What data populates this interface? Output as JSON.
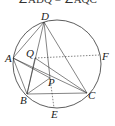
{
  "caption_fragment": "∠ADQ = ∠AQC",
  "circle": {
    "cx": 57,
    "cy": 64,
    "r": 44
  },
  "points": {
    "D": {
      "x": 44,
      "y": 22,
      "label": "D",
      "lx": 41,
      "ly": 20
    },
    "A": {
      "x": 13,
      "y": 58,
      "label": "A",
      "lx": 5,
      "ly": 62
    },
    "Q": {
      "x": 35,
      "y": 58,
      "label": "Q",
      "lx": 26,
      "ly": 57
    },
    "F": {
      "x": 100,
      "y": 55,
      "label": "F",
      "lx": 102,
      "ly": 60
    },
    "B": {
      "x": 27,
      "y": 94,
      "label": "B",
      "lx": 20,
      "ly": 104
    },
    "C": {
      "x": 87,
      "y": 93,
      "label": "C",
      "lx": 88,
      "ly": 99
    },
    "P": {
      "x": 50,
      "y": 78,
      "label": "P",
      "lx": 48,
      "ly": 86
    },
    "E": {
      "x": 54,
      "y": 108,
      "label": "E",
      "lx": 51,
      "ly": 118
    }
  },
  "segments": [
    {
      "from": "D",
      "to": "A",
      "style": "solid"
    },
    {
      "from": "D",
      "to": "B",
      "style": "solid"
    },
    {
      "from": "D",
      "to": "P",
      "style": "solid"
    },
    {
      "from": "D",
      "to": "C",
      "style": "solid"
    },
    {
      "from": "A",
      "to": "C",
      "style": "solid"
    },
    {
      "from": "A",
      "to": "B",
      "style": "solid"
    },
    {
      "from": "B",
      "to": "C",
      "style": "solid"
    },
    {
      "from": "A",
      "to": "P",
      "style": "solid"
    },
    {
      "from": "B",
      "to": "Q",
      "style": "solid"
    },
    {
      "from": "Q",
      "to": "C",
      "style": "solid"
    },
    {
      "from": "B",
      "to": "P",
      "style": "solid"
    },
    {
      "from": "Q",
      "to": "F",
      "style": "dashed"
    },
    {
      "from": "P",
      "to": "E",
      "style": "dashed"
    }
  ],
  "colors": {
    "stroke": "#333333",
    "label": "#222222",
    "background": "#ffffff"
  }
}
